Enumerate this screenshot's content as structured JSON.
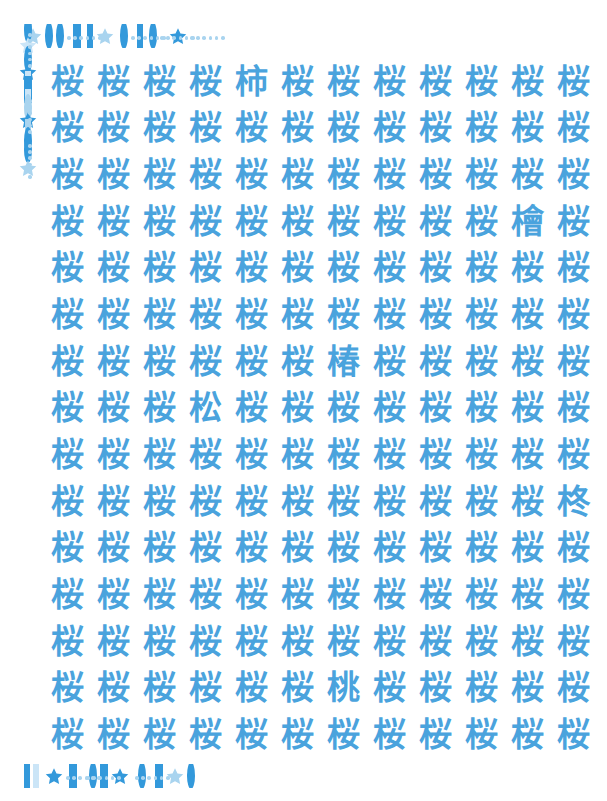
{
  "page": {
    "background_color": "#ffffff",
    "accent_color": "#4aa3dd"
  },
  "colors": {
    "kanji_blue": "#4aa3dd",
    "ornament_dark": "#3399db",
    "ornament_mid": "#57aee4",
    "ornament_light": "#a9d4ef",
    "ornament_pale": "#cbe5f7"
  },
  "grid": {
    "rows": 15,
    "columns": 12,
    "base_character": "桜",
    "odd_characters": [
      {
        "row": 1,
        "column": 5,
        "char": "柿"
      },
      {
        "row": 4,
        "column": 11,
        "char": "檜"
      },
      {
        "row": 7,
        "column": 7,
        "char": "椿"
      },
      {
        "row": 8,
        "column": 4,
        "char": "松"
      },
      {
        "row": 10,
        "column": 12,
        "char": "柊"
      },
      {
        "row": 14,
        "column": 7,
        "char": "桃"
      }
    ],
    "cells": [
      [
        "桜",
        "桜",
        "桜",
        "桜",
        "柿",
        "桜",
        "桜",
        "桜",
        "桜",
        "桜",
        "桜",
        "桜"
      ],
      [
        "桜",
        "桜",
        "桜",
        "桜",
        "桜",
        "桜",
        "桜",
        "桜",
        "桜",
        "桜",
        "桜",
        "桜"
      ],
      [
        "桜",
        "桜",
        "桜",
        "桜",
        "桜",
        "桜",
        "桜",
        "桜",
        "桜",
        "桜",
        "桜",
        "桜"
      ],
      [
        "桜",
        "桜",
        "桜",
        "桜",
        "桜",
        "桜",
        "桜",
        "桜",
        "桜",
        "桜",
        "檜",
        "桜"
      ],
      [
        "桜",
        "桜",
        "桜",
        "桜",
        "桜",
        "桜",
        "桜",
        "桜",
        "桜",
        "桜",
        "桜",
        "桜"
      ],
      [
        "桜",
        "桜",
        "桜",
        "桜",
        "桜",
        "桜",
        "桜",
        "桜",
        "桜",
        "桜",
        "桜",
        "桜"
      ],
      [
        "桜",
        "桜",
        "桜",
        "桜",
        "桜",
        "桜",
        "椿",
        "桜",
        "桜",
        "桜",
        "桜",
        "桜"
      ],
      [
        "桜",
        "桜",
        "桜",
        "松",
        "桜",
        "桜",
        "桜",
        "桜",
        "桜",
        "桜",
        "桜",
        "桜"
      ],
      [
        "桜",
        "桜",
        "桜",
        "桜",
        "桜",
        "桜",
        "桜",
        "桜",
        "桜",
        "桜",
        "桜",
        "桜"
      ],
      [
        "桜",
        "桜",
        "桜",
        "桜",
        "桜",
        "桜",
        "桜",
        "桜",
        "桜",
        "桜",
        "桜",
        "柊"
      ],
      [
        "桜",
        "桜",
        "桜",
        "桜",
        "桜",
        "桜",
        "桜",
        "桜",
        "桜",
        "桜",
        "桜",
        "桜"
      ],
      [
        "桜",
        "桜",
        "桜",
        "桜",
        "桜",
        "桜",
        "桜",
        "桜",
        "桜",
        "桜",
        "桜",
        "桜"
      ],
      [
        "桜",
        "桜",
        "桜",
        "桜",
        "桜",
        "桜",
        "桜",
        "桜",
        "桜",
        "桜",
        "桜",
        "桜"
      ],
      [
        "桜",
        "桜",
        "桜",
        "桜",
        "桜",
        "桜",
        "桃",
        "桜",
        "桜",
        "桜",
        "桜",
        "桜"
      ],
      [
        "桜",
        "桜",
        "桜",
        "桜",
        "桜",
        "桜",
        "桜",
        "桜",
        "桜",
        "桜",
        "桜",
        "桜"
      ]
    ]
  },
  "border": {
    "top": [
      {
        "shape": "circle-fill",
        "tone": "dark"
      },
      {
        "shape": "double-line",
        "tone": "mid"
      },
      {
        "shape": "star",
        "tone": "light"
      },
      {
        "shape": "circle-open",
        "tone": "dark"
      },
      {
        "shape": "circle-open",
        "tone": "dark"
      },
      {
        "shape": "dots",
        "tone": "light"
      },
      {
        "shape": "circle-fill",
        "tone": "dark"
      },
      {
        "shape": "square-open",
        "tone": "dark"
      },
      {
        "shape": "diamond-fill",
        "tone": "light"
      },
      {
        "shape": "diamond-open",
        "tone": "dark"
      },
      {
        "shape": "star",
        "tone": "light"
      },
      {
        "shape": "double-line",
        "tone": "mid"
      },
      {
        "shape": "circle-open",
        "tone": "dark"
      },
      {
        "shape": "dots",
        "tone": "light"
      },
      {
        "shape": "circle-fill",
        "tone": "mid"
      },
      {
        "shape": "diamond-open",
        "tone": "dark"
      },
      {
        "shape": "square-fill",
        "tone": "mid"
      },
      {
        "shape": "circle-open",
        "tone": "dark"
      },
      {
        "shape": "dots",
        "tone": "light"
      },
      {
        "shape": "circle-fill",
        "tone": "mid"
      },
      {
        "shape": "double-line",
        "tone": "mid"
      },
      {
        "shape": "star",
        "tone": "dark"
      },
      {
        "shape": "dots",
        "tone": "light"
      }
    ],
    "bottom": [
      {
        "shape": "circle-fill",
        "tone": "dark"
      },
      {
        "shape": "square-fill",
        "tone": "mid"
      },
      {
        "shape": "diamond-open",
        "tone": "dark"
      },
      {
        "shape": "diamond-open",
        "tone": "pale"
      },
      {
        "shape": "double-line",
        "tone": "mid"
      },
      {
        "shape": "star",
        "tone": "dark"
      },
      {
        "shape": "dots",
        "tone": "light"
      },
      {
        "shape": "square-open",
        "tone": "dark"
      },
      {
        "shape": "double-line",
        "tone": "mid"
      },
      {
        "shape": "circle-fill",
        "tone": "light"
      },
      {
        "shape": "dots",
        "tone": "light"
      },
      {
        "shape": "circle-open",
        "tone": "dark"
      },
      {
        "shape": "square-open",
        "tone": "dark"
      },
      {
        "shape": "star",
        "tone": "dark"
      },
      {
        "shape": "circle-fill",
        "tone": "light"
      },
      {
        "shape": "dots",
        "tone": "light"
      },
      {
        "shape": "circle-open",
        "tone": "dark"
      },
      {
        "shape": "double-line",
        "tone": "pale"
      },
      {
        "shape": "square-fill",
        "tone": "light"
      },
      {
        "shape": "square-open",
        "tone": "dark"
      },
      {
        "shape": "star",
        "tone": "light"
      },
      {
        "shape": "circle-open",
        "tone": "dark"
      },
      {
        "shape": "double-line",
        "tone": "mid"
      }
    ],
    "left": [
      {
        "shape": "circle-fill",
        "tone": "dark"
      },
      {
        "shape": "double-line",
        "tone": "pale"
      },
      {
        "shape": "circle-open",
        "tone": "dark"
      },
      {
        "shape": "dots",
        "tone": "light"
      },
      {
        "shape": "star",
        "tone": "pale"
      },
      {
        "shape": "double-line",
        "tone": "pale"
      },
      {
        "shape": "circle-open",
        "tone": "dark"
      },
      {
        "shape": "star",
        "tone": "dark"
      },
      {
        "shape": "diamond-open",
        "tone": "pale"
      },
      {
        "shape": "circle-fill",
        "tone": "dark"
      },
      {
        "shape": "square-open",
        "tone": "dark"
      },
      {
        "shape": "diamond-fill",
        "tone": "dark"
      },
      {
        "shape": "circle-open",
        "tone": "dark"
      },
      {
        "shape": "dots",
        "tone": "light"
      },
      {
        "shape": "diamond-open",
        "tone": "pale"
      },
      {
        "shape": "double-line",
        "tone": "pale"
      },
      {
        "shape": "circle-open",
        "tone": "light"
      },
      {
        "shape": "star",
        "tone": "dark"
      },
      {
        "shape": "diamond-open",
        "tone": "light"
      },
      {
        "shape": "circle-fill",
        "tone": "dark"
      },
      {
        "shape": "double-line",
        "tone": "pale"
      },
      {
        "shape": "circle-open",
        "tone": "dark"
      },
      {
        "shape": "dots",
        "tone": "light"
      },
      {
        "shape": "circle-fill",
        "tone": "dark"
      },
      {
        "shape": "circle-open",
        "tone": "dark"
      },
      {
        "shape": "double-line",
        "tone": "pale"
      },
      {
        "shape": "diamond-fill",
        "tone": "dark"
      },
      {
        "shape": "star",
        "tone": "light"
      },
      {
        "shape": "circle-fill",
        "tone": "dark"
      }
    ]
  }
}
